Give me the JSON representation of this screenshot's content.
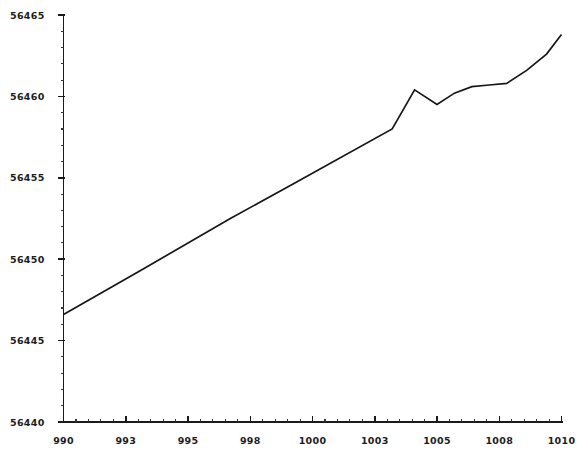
{
  "chart_data": {
    "type": "line",
    "title": "",
    "subtitle": "",
    "xlabel": "",
    "ylabel": "",
    "xlim": [
      990,
      1010
    ],
    "ylim": [
      56440,
      56465
    ],
    "grid": false,
    "legend": null,
    "x_ticks": [
      {
        "value": 990,
        "label": "990",
        "major": true
      },
      {
        "value": 992.5,
        "label": "993",
        "major": true
      },
      {
        "value": 995,
        "label": "995",
        "major": true
      },
      {
        "value": 997.5,
        "label": "998",
        "major": true
      },
      {
        "value": 1000,
        "label": "1000",
        "major": true
      },
      {
        "value": 1002.5,
        "label": "1003",
        "major": true
      },
      {
        "value": 1005,
        "label": "1005",
        "major": true
      },
      {
        "value": 1007.5,
        "label": "1008",
        "major": true
      },
      {
        "value": 1010,
        "label": "1010",
        "major": true
      }
    ],
    "y_ticks": [
      {
        "value": 56440,
        "label": "56440",
        "major": true
      },
      {
        "value": 56445,
        "label": "56445",
        "major": true
      },
      {
        "value": 56450,
        "label": "56450",
        "major": true
      },
      {
        "value": 56455,
        "label": "56455",
        "major": true
      },
      {
        "value": 56460,
        "label": "56460",
        "major": true
      },
      {
        "value": 56465,
        "label": "56465",
        "major": true
      }
    ],
    "x_minor_step": 0.5,
    "y_minor_step": 1.0,
    "series": [
      {
        "name": "series-1",
        "color": "#161616",
        "x": [
          990.0,
          993.2,
          996.7,
          999.2,
          1003.2,
          1004.1,
          1005.0,
          1005.7,
          1006.4,
          1007.1,
          1007.8,
          1008.6,
          1009.4,
          1010.0
        ],
        "y": [
          56446.6,
          56449.4,
          56452.5,
          56454.6,
          56458.0,
          56460.4,
          56459.5,
          56460.2,
          56460.6,
          56460.7,
          56460.8,
          56461.6,
          56462.6,
          56463.8
        ]
      }
    ]
  }
}
